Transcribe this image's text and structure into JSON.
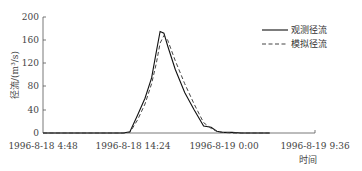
{
  "chart_data": {
    "type": "line",
    "title": "",
    "xlabel": "时间",
    "ylabel": "径流/(m³/s)",
    "ylim": [
      0,
      200
    ],
    "yticks": [
      0,
      40,
      80,
      120,
      160,
      200
    ],
    "xticks": [
      "1996-8-18 4:48",
      "1996-8-18 14:24",
      "1996-8-19 0:00",
      "1996-8-19 9:36"
    ],
    "grid": false,
    "legend_position": "upper right",
    "x_hours": [
      0,
      8.5,
      9.2,
      10.0,
      10.8,
      11.5,
      12.0,
      12.4,
      12.8,
      13.2,
      14.0,
      15.0,
      16.0,
      17.0,
      17.8,
      18.4,
      19.0,
      20.0,
      21.0,
      24.0
    ],
    "series": [
      {
        "name": "观测径流",
        "style": "solid",
        "values": [
          0,
          0,
          2,
          30,
          60,
          95,
          140,
          175,
          172,
          150,
          110,
          70,
          40,
          12,
          10,
          3,
          1,
          1,
          0,
          0
        ]
      },
      {
        "name": "模拟径流",
        "style": "dashed",
        "values": [
          0,
          0,
          1,
          22,
          50,
          85,
          120,
          155,
          168,
          160,
          125,
          85,
          50,
          18,
          8,
          3,
          1,
          0,
          0,
          0
        ]
      }
    ]
  },
  "axis": {
    "ylabel": "径流/(m³/s)",
    "xlabel": "时间",
    "yticks": [
      "0",
      "40",
      "80",
      "120",
      "160",
      "200"
    ],
    "xticks": [
      "1996-8-18 4:48",
      "1996-8-18 14:24",
      "1996-8-19 0:00",
      "1996-8-19 9:36"
    ]
  },
  "legend": {
    "observed": "观测径流",
    "simulated": "模拟径流"
  }
}
